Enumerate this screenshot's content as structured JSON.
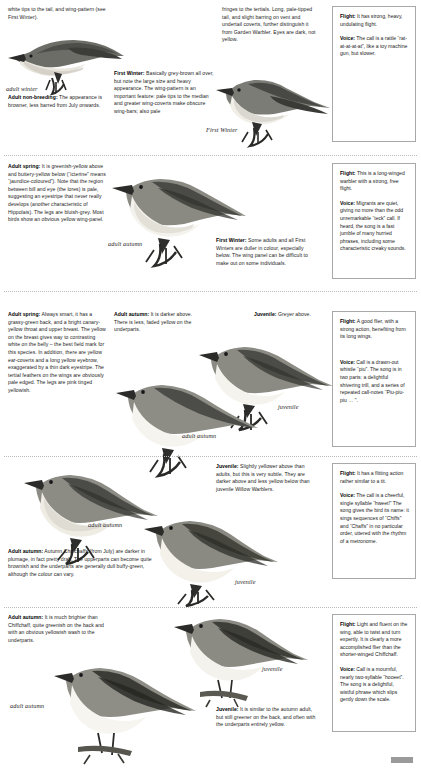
{
  "page": {
    "footer_mark": "page-tab"
  },
  "sections": [
    {
      "id": "icterine-warbler-top",
      "texts": [
        {
          "name": "intro-continuation-text",
          "lead": "",
          "body": "white tips to the tail, and wing-pattern (see First Winter)."
        },
        {
          "name": "adult-non-breeding-text",
          "lead": "Adult non-breeding:",
          "body": " The appearance is browner, less barred from July onwards."
        },
        {
          "name": "first-winter-text",
          "lead": "First Winter:",
          "body": " Basically grey-brown all over, but note the large size and heavy appearance. The wing-pattern is an important feature: pale tips to the median and greater wing-coverts make obscure wing-bars; also pale"
        },
        {
          "name": "tertial-fringes-text",
          "lead": "",
          "body": "fringes to the tertials. Long, pale-tipped tail, and slight barring on vent and undertail coverts, further distinguish it from Garden Warbler. Eyes are dark, not yellow."
        }
      ],
      "captions": [
        {
          "name": "caption-adult-winter",
          "label": "adult winter"
        },
        {
          "name": "caption-first-winter",
          "label": "First Winter"
        }
      ],
      "infobox": {
        "name": "infobox-barred-warbler",
        "flight_label": "Flight:",
        "flight_text": " It has strong, heavy, undulating flight.",
        "voice_label": "Voice:",
        "voice_text": " The call is a rattle “rat-at-at-at-at”, like a toy machine gun, but slower."
      }
    },
    {
      "id": "icterine-warbler",
      "texts": [
        {
          "name": "adult-spring-icterine-text",
          "lead": "Adult spring:",
          "body": " It is greenish-yellow above and buttery-yellow below (“icterine” means “jaundice-coloured”). Note that the region between bill and eye (the lores) is pale, suggesting an eyestripe that never really develops (another characteristic of Hippolais). The legs are bluish-grey. Most birds show an obvious yellow wing-panel."
        },
        {
          "name": "first-winter-icterine-text",
          "lead": "First Winter:",
          "body": " Some adults and all First Winters are duller in colour, especially below. The wing panel can be difficult to make out on some individuals."
        }
      ],
      "captions": [
        {
          "name": "caption-adult-autumn-icterine",
          "label": "adult autumn"
        }
      ],
      "infobox": {
        "name": "infobox-icterine-warbler",
        "flight_label": "Flight:",
        "flight_text": " This is a long-winged warbler with a strong, free flight.",
        "voice_label": "Voice:",
        "voice_text": " Migrants are quiet, giving no more than the odd unremarkable “teck” call. If heard, the song is a fast jumble of many hurried phrases, including some characteristic creaky sounds."
      }
    },
    {
      "id": "wood-warbler",
      "texts": [
        {
          "name": "adult-spring-wood-text",
          "lead": "Adult spring:",
          "body": " Always smart, it has a grassy-green back, and a bright canary-yellow throat and upper breast. The yellow on the breast gives way to contrasting white on the belly – the best field mark for this species. In addition, there are yellow ear-coverts and a long yellow eyebrow, exaggerated by a thin dark eyestripe. The tertial feathers on the wings are obviously pale edged. The legs are pink tinged yellowish."
        },
        {
          "name": "adult-autumn-wood-text",
          "lead": "Adult autumn:",
          "body": " It is darker above. There is less, faded yellow on the underparts."
        },
        {
          "name": "juvenile-wood-text",
          "lead": "Juvenile:",
          "body": " Greyer above."
        }
      ],
      "captions": [
        {
          "name": "caption-juvenile-wood",
          "label": "juvenile"
        },
        {
          "name": "caption-adult-autumn-wood",
          "label": "adult autumn"
        }
      ],
      "infobox": {
        "name": "infobox-wood-warbler",
        "flight_label": "Flight:",
        "flight_text": " A good flier, with a strong action, benefiting from its long wings.",
        "voice_label": "Voice:",
        "voice_text": " Call is a drawn-out whistle “piu”. The song is in two parts: a delightful shivering trill, and a series of repeated call-notes “Piu-piu-piu … ”."
      }
    },
    {
      "id": "chiffchaff",
      "texts": [
        {
          "name": "juvenile-chiffchaff-text",
          "lead": "Juvenile:",
          "body": " Slightly yellower above than adults, but this is very subtle. They are darker above and less yellow below than juvenile Willow Warblers."
        },
        {
          "name": "adult-autumn-chiffchaff-text",
          "lead": "Adult autumn:",
          "body": " Autumn Chiffchaffs (from July) are darker in plumage, in fact pretty drab. The upperparts can become quite brownish and the underparts are generally dull buffy-green, although the colour can vary."
        }
      ],
      "captions": [
        {
          "name": "caption-adult-autumn-chiffchaff",
          "label": "adult autumn"
        },
        {
          "name": "caption-juvenile-chiffchaff",
          "label": "juvenile"
        }
      ],
      "infobox": {
        "name": "infobox-chiffchaff",
        "flight_label": "Flight:",
        "flight_text": " It has a flitting action rather similar to a tit.",
        "voice_label": "Voice:",
        "voice_text": " The call is a cheerful, single syllable “hweet!” The song gives the bird its name: it sings sequences of “Chiffs” and “Chaffs” in no particular order, uttered with the rhythm of a metronome."
      }
    },
    {
      "id": "willow-warbler",
      "texts": [
        {
          "name": "adult-autumn-willow-text",
          "lead": "Adult autumn:",
          "body": " It is much brighter than Chiffchaff, quite greenish on the back and with an obvious yellowish wash to the underparts."
        },
        {
          "name": "juvenile-willow-text",
          "lead": "Juvenile:",
          "body": " It is similar to the autumn adult, but still greener on the back, and often with the underparts entirely yellow."
        }
      ],
      "captions": [
        {
          "name": "caption-juvenile-willow",
          "label": "juvenile"
        },
        {
          "name": "caption-adult-autumn-willow",
          "label": "adult autumn"
        }
      ],
      "infobox": {
        "name": "infobox-willow-warbler",
        "flight_label": "Flight:",
        "flight_text": " Light and fluent on the wing, able to twist and turn expertly. It is clearly a more accomplished flier than the shorter-winged Chiffchaff.",
        "voice_label": "Voice:",
        "voice_text": " Call is a mournful, nearly two-syllable “hooeet”. The song is a delightful, wistful phrase which slips gently down the scale."
      }
    }
  ],
  "colors": {
    "text": "#1b1b1b",
    "rule": "#b9b9b9",
    "box_border": "#a8a8a8",
    "bird_dark": "#4a4a48",
    "bird_mid": "#8d8d88",
    "bird_light": "#d8d6cf",
    "bird_belly": "#f2f0ea"
  }
}
